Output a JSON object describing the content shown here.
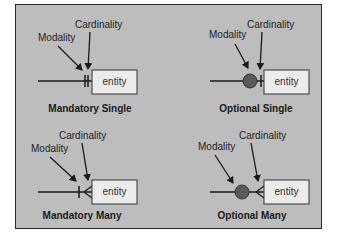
{
  "diagram": {
    "colors": {
      "background": "#bdbdbd",
      "frame_border": "#2a2a2a",
      "entity_fill": "#ececec",
      "optional_circle": "#5a5a5a",
      "line": "#1a1a1a"
    },
    "panels": [
      {
        "id": "mandatory-single",
        "caption": "Mandatory Single",
        "modality_label": "Modality",
        "cardinality_label": "Cardinality",
        "entity_label": "entity",
        "modality_symbol": "bar",
        "cardinality_symbol": "bar"
      },
      {
        "id": "optional-single",
        "caption": "Optional Single",
        "modality_label": "Modality",
        "cardinality_label": "Cardinality",
        "entity_label": "entity",
        "modality_symbol": "circle",
        "cardinality_symbol": "bar"
      },
      {
        "id": "mandatory-many",
        "caption": "Mandatory Many",
        "modality_label": "Modality",
        "cardinality_label": "Cardinality",
        "entity_label": "entity",
        "modality_symbol": "bar",
        "cardinality_symbol": "crows-foot"
      },
      {
        "id": "optional-many",
        "caption": "Optional Many",
        "modality_label": "Modality",
        "cardinality_label": "Cardinality",
        "entity_label": "entity",
        "modality_symbol": "circle",
        "cardinality_symbol": "crows-foot"
      }
    ]
  }
}
